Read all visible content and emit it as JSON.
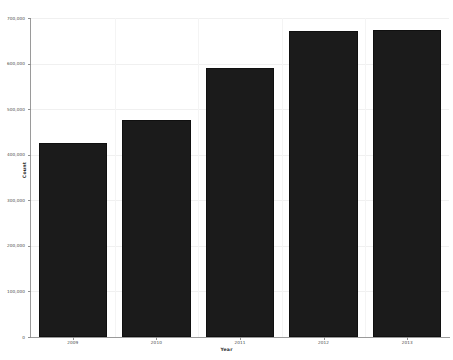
{
  "chart_data": {
    "type": "bar",
    "title": "",
    "xlabel": "Year",
    "ylabel": "Count",
    "categories": [
      "2009",
      "2010",
      "2011",
      "2012",
      "2013"
    ],
    "values": [
      426000,
      476000,
      590000,
      672000,
      674000
    ],
    "ylim": [
      0,
      700000
    ],
    "xlim": [
      0,
      5
    ],
    "ytick_labels": [
      "0",
      "100,000",
      "200,000",
      "300,000",
      "400,000",
      "500,000",
      "600,000",
      "700,000"
    ],
    "ytick_values": [
      0,
      100000,
      200000,
      300000,
      400000,
      500000,
      600000,
      700000
    ],
    "xtick_labels": [
      "2009",
      "2010",
      "2011",
      "2012",
      "2013"
    ],
    "grid": true,
    "grid_axis": "both",
    "legend": false,
    "legend_position": "none",
    "bar_color": "#1b1b1b",
    "bar_edge_color": "#101010",
    "grid_color": "#f0f0f0",
    "background_color": "#ffffff",
    "axis_color": "#9a9a9a",
    "series": [
      {
        "name": "Count",
        "values": [
          426000,
          476000,
          590000,
          672000,
          674000
        ]
      }
    ]
  },
  "figure": {
    "title_text": "",
    "axis_titles": {
      "x": "Year",
      "y": "Count"
    }
  }
}
